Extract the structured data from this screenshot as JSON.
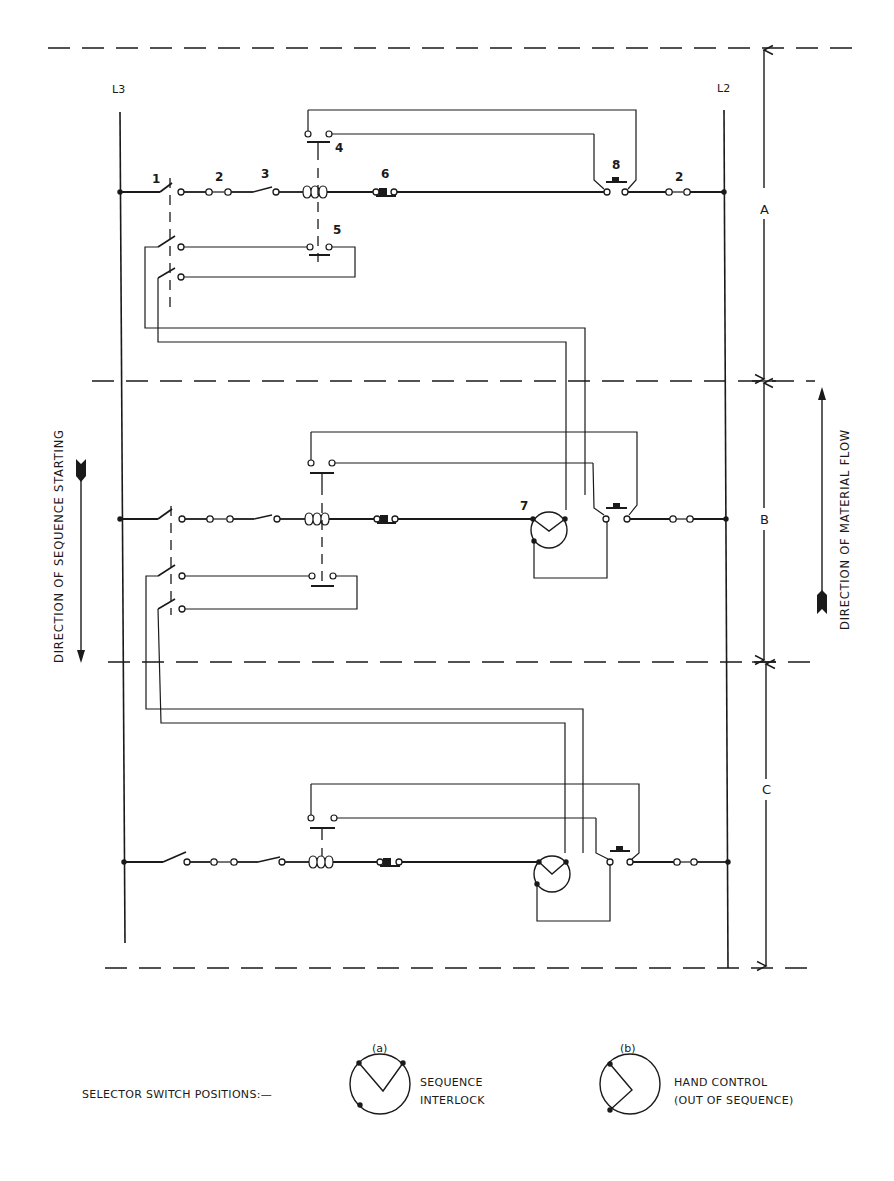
{
  "diagram": {
    "rails": {
      "left": "L3",
      "right": "L2"
    },
    "sections": [
      {
        "label": "A",
        "y_top": 48,
        "y_bottom": 381
      },
      {
        "label": "B",
        "y_top": 381,
        "y_bottom": 662
      },
      {
        "label": "C",
        "y_top": 662,
        "y_bottom": 968
      }
    ],
    "component_numbers": {
      "c1": "1",
      "c2": "2",
      "c3": "3",
      "c4": "4",
      "c5": "5",
      "c6": "6",
      "c7": "7",
      "c8": "8",
      "c2b": "2"
    },
    "directions": {
      "sequence_starting": "DIRECTION OF SEQUENCE STARTING",
      "material_flow": "DIRECTION OF MATERIAL FLOW"
    },
    "colors": {
      "ink": "#1a1a1a",
      "background": "#ffffff"
    }
  },
  "legend": {
    "title": "SELECTOR SWITCH POSITIONS:—",
    "items": [
      {
        "tag": "(a)",
        "line1": "SEQUENCE",
        "line2": "INTERLOCK",
        "symbol": "selector-sequence-interlock"
      },
      {
        "tag": "(b)",
        "line1": "HAND CONTROL",
        "line2": "(OUT OF SEQUENCE)",
        "symbol": "selector-hand-control"
      }
    ]
  }
}
